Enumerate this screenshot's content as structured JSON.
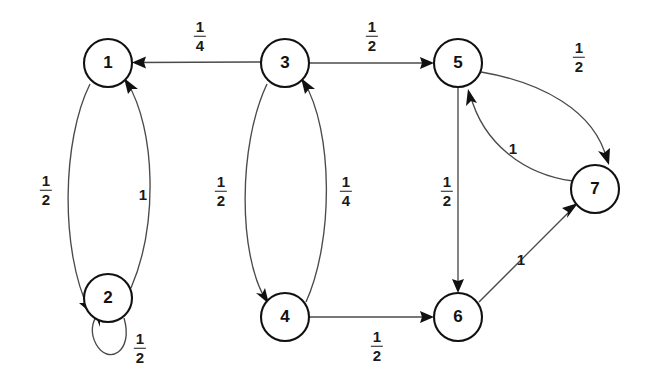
{
  "diagram": {
    "type": "directed-graph",
    "background_color": "#ffffff",
    "node_stroke_color": "#111111",
    "edge_stroke_color": "#4a4a4a",
    "nodes": [
      {
        "id": "1",
        "label": "1",
        "cx": 108,
        "cy": 63,
        "r": 24
      },
      {
        "id": "2",
        "label": "2",
        "cx": 108,
        "cy": 298,
        "r": 24
      },
      {
        "id": "3",
        "label": "3",
        "cx": 285,
        "cy": 63,
        "r": 24
      },
      {
        "id": "4",
        "label": "4",
        "cx": 285,
        "cy": 317,
        "r": 24
      },
      {
        "id": "5",
        "label": "5",
        "cx": 458,
        "cy": 63,
        "r": 24
      },
      {
        "id": "6",
        "label": "6",
        "cx": 458,
        "cy": 317,
        "r": 24
      },
      {
        "id": "7",
        "label": "7",
        "cx": 595,
        "cy": 189,
        "r": 24
      }
    ],
    "edges": [
      {
        "from": "3",
        "to": "1",
        "label": "1/4",
        "numerator": "1",
        "denominator": "4",
        "label_x": 200,
        "label_y": 36
      },
      {
        "from": "3",
        "to": "5",
        "label": "1/2",
        "numerator": "1",
        "denominator": "2",
        "label_x": 372,
        "label_y": 36
      },
      {
        "from": "1",
        "to": "2",
        "label": "1/2",
        "numerator": "1",
        "denominator": "2",
        "label_x": 46,
        "label_y": 190
      },
      {
        "from": "2",
        "to": "1",
        "label": "1",
        "numerator": "1",
        "denominator": "",
        "label_x": 143,
        "label_y": 194
      },
      {
        "from": "2",
        "to": "2",
        "label": "1/2",
        "numerator": "1",
        "denominator": "2",
        "label_x": 140,
        "label_y": 348
      },
      {
        "from": "3",
        "to": "4",
        "label": "1/2",
        "numerator": "1",
        "denominator": "2",
        "label_x": 221,
        "label_y": 191
      },
      {
        "from": "4",
        "to": "3",
        "label": "1/4",
        "numerator": "1",
        "denominator": "4",
        "label_x": 346,
        "label_y": 191
      },
      {
        "from": "5",
        "to": "6",
        "label": "1/2",
        "numerator": "1",
        "denominator": "2",
        "label_x": 447,
        "label_y": 191
      },
      {
        "from": "4",
        "to": "6",
        "label": "1/2",
        "numerator": "1",
        "denominator": "2",
        "label_x": 377,
        "label_y": 346
      },
      {
        "from": "6",
        "to": "7",
        "label": "1",
        "numerator": "1",
        "denominator": "",
        "label_x": 521,
        "label_y": 259
      },
      {
        "from": "7",
        "to": "5",
        "label": "1",
        "numerator": "1",
        "denominator": "",
        "label_x": 513,
        "label_y": 148
      },
      {
        "from": "5",
        "to": "7",
        "label": "1/2",
        "numerator": "1",
        "denominator": "2",
        "label_x": 579,
        "label_y": 57
      }
    ]
  }
}
